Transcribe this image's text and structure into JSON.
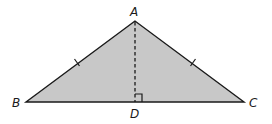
{
  "diagram": {
    "type": "isosceles triangle with altitude",
    "fill_color": "#c8c8c8",
    "stroke_color": "#1a1a1a",
    "vertices": {
      "A": {
        "label": "A",
        "x": 135,
        "y": 21
      },
      "B": {
        "label": "B",
        "x": 26,
        "y": 102
      },
      "C": {
        "label": "C",
        "x": 244,
        "y": 102
      },
      "D": {
        "label": "D",
        "x": 135,
        "y": 102
      }
    },
    "segments": [
      {
        "from": "A",
        "to": "B",
        "style": "solid",
        "tick_marks": 1
      },
      {
        "from": "A",
        "to": "C",
        "style": "solid",
        "tick_marks": 1
      },
      {
        "from": "B",
        "to": "C",
        "style": "solid"
      },
      {
        "from": "A",
        "to": "D",
        "style": "dashed"
      }
    ],
    "right_angle_at": "D"
  }
}
